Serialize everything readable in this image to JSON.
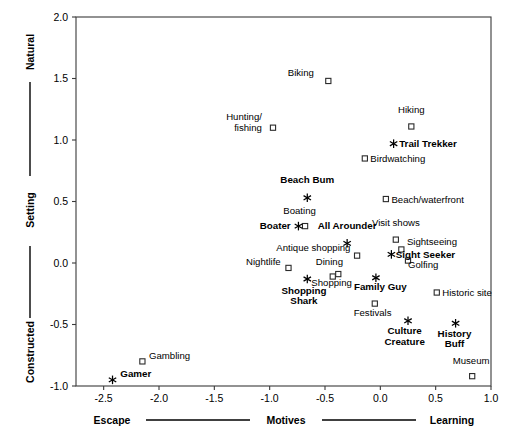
{
  "chart_data": {
    "type": "scatter",
    "title": "",
    "xlabel": "Motives",
    "ylabel": "Setting",
    "xlim": [
      -2.75,
      1.0
    ],
    "ylim": [
      -1.0,
      2.0
    ],
    "xticks": [
      -2.5,
      -2.0,
      -1.5,
      -1.0,
      -0.5,
      0.0,
      0.5,
      1.0
    ],
    "xticklabels": [
      "-2.5",
      "-2.0",
      "-1.5",
      "-1.0",
      "-0.5",
      "0.0",
      "0.5",
      "1.0"
    ],
    "yticks": [
      -1.0,
      -0.5,
      0.0,
      0.5,
      1.0,
      1.5,
      2.0
    ],
    "yticklabels": [
      "-1.0",
      "-0.5",
      "0.0",
      "0.5",
      "1.0",
      "1.5",
      "2.0"
    ],
    "grid": false,
    "legend": "none",
    "x_axis_anchors": {
      "low": "Escape",
      "center": "Motives",
      "high": "Learning"
    },
    "y_axis_anchors": {
      "low": "Constructed",
      "center": "Setting",
      "high": "Natural"
    },
    "series": [
      {
        "name": "Activities",
        "marker": "square",
        "bold": false,
        "points": [
          {
            "label": "Biking",
            "x": -0.47,
            "y": 1.48,
            "lx": -0.6,
            "ly": 1.52,
            "align": "end"
          },
          {
            "label": "Hunting/\nfishing",
            "x": -0.97,
            "y": 1.1,
            "lx": -1.07,
            "ly": 1.16,
            "align": "end"
          },
          {
            "label": "Hiking",
            "x": 0.28,
            "y": 1.11,
            "lx": 0.28,
            "ly": 1.22,
            "align": "mid"
          },
          {
            "label": "Birdwatching",
            "x": -0.14,
            "y": 0.85,
            "lx": -0.09,
            "ly": 0.82,
            "align": "start"
          },
          {
            "label": "Beach/waterfront",
            "x": 0.05,
            "y": 0.52,
            "lx": 0.1,
            "ly": 0.49,
            "align": "start"
          },
          {
            "label": "Boating",
            "x": -0.68,
            "y": 0.3,
            "lx": -0.73,
            "ly": 0.4,
            "align": "mid"
          },
          {
            "label": "Visit shows",
            "x": 0.14,
            "y": 0.19,
            "lx": 0.14,
            "ly": 0.3,
            "align": "mid"
          },
          {
            "label": "Sightseeing",
            "x": 0.19,
            "y": 0.11,
            "lx": 0.24,
            "ly": 0.15,
            "align": "start"
          },
          {
            "label": "Antique shopping",
            "x": -0.21,
            "y": 0.06,
            "lx": -0.27,
            "ly": 0.1,
            "align": "end"
          },
          {
            "label": "Golfing",
            "x": 0.25,
            "y": 0.02,
            "lx": 0.25,
            "ly": -0.04,
            "align": "start"
          },
          {
            "label": "Nightlife",
            "x": -0.83,
            "y": -0.04,
            "lx": -0.9,
            "ly": -0.02,
            "align": "end"
          },
          {
            "label": "Dining",
            "x": -0.43,
            "y": -0.11,
            "lx": -0.46,
            "ly": -0.02,
            "align": "mid"
          },
          {
            "label": "Shopping",
            "x": -0.38,
            "y": -0.09,
            "lx": -0.44,
            "ly": -0.19,
            "align": "mid"
          },
          {
            "label": "Historic site",
            "x": 0.51,
            "y": -0.24,
            "lx": 0.56,
            "ly": -0.27,
            "align": "start"
          },
          {
            "label": "Festivals",
            "x": -0.05,
            "y": -0.33,
            "lx": -0.07,
            "ly": -0.43,
            "align": "mid"
          },
          {
            "label": "Museum",
            "x": 0.83,
            "y": -0.92,
            "lx": 0.82,
            "ly": -0.82,
            "align": "mid"
          },
          {
            "label": "Gambling",
            "x": -2.15,
            "y": -0.8,
            "lx": -2.09,
            "ly": -0.78,
            "align": "start"
          }
        ]
      },
      {
        "name": "Segments",
        "marker": "star",
        "bold": true,
        "points": [
          {
            "label": "Trail Trekker",
            "x": 0.12,
            "y": 0.97,
            "lx": 0.17,
            "ly": 0.94,
            "align": "start"
          },
          {
            "label": "Beach Bum",
            "x": -0.66,
            "y": 0.53,
            "lx": -0.66,
            "ly": 0.65,
            "align": "mid"
          },
          {
            "label": "Boater",
            "x": -0.74,
            "y": 0.3,
            "lx": -0.81,
            "ly": 0.28,
            "align": "end"
          },
          {
            "label": "All Arounder",
            "x": -0.3,
            "y": 0.16,
            "lx": -0.3,
            "ly": 0.28,
            "align": "mid"
          },
          {
            "label": "Sight Seeker",
            "x": 0.1,
            "y": 0.07,
            "lx": 0.14,
            "ly": 0.04,
            "align": "start"
          },
          {
            "label": "Family Guy",
            "x": -0.04,
            "y": -0.12,
            "lx": 0.0,
            "ly": -0.22,
            "align": "mid"
          },
          {
            "label": "Shopping\nShark",
            "x": -0.66,
            "y": -0.13,
            "lx": -0.69,
            "ly": -0.25,
            "align": "mid"
          },
          {
            "label": "Culture\nCreature",
            "x": 0.25,
            "y": -0.47,
            "lx": 0.22,
            "ly": -0.58,
            "align": "mid"
          },
          {
            "label": "History\nBuff",
            "x": 0.68,
            "y": -0.49,
            "lx": 0.67,
            "ly": -0.6,
            "align": "mid"
          },
          {
            "label": "Gamer",
            "x": -2.42,
            "y": -0.95,
            "lx": -2.35,
            "ly": -0.93,
            "align": "start"
          }
        ]
      }
    ]
  },
  "colors": {
    "frame": "#3a3a3a",
    "text": "#000000",
    "marker_stroke": "#2b2b2b",
    "background": "#ffffff"
  }
}
